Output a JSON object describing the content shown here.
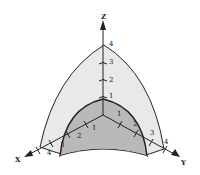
{
  "diagram": {
    "type": "3d-octant-spherical-shells",
    "axes": {
      "z": {
        "label": "Z",
        "ticks": [
          "1",
          "2",
          "3",
          "4"
        ]
      },
      "x": {
        "label": "X",
        "ticks": [
          "1",
          "2",
          "3",
          "4"
        ]
      },
      "y": {
        "label": "Y",
        "ticks": [
          "1",
          "2",
          "3",
          "4"
        ]
      }
    },
    "regions": {
      "outer_shell": {
        "radius_label": "4",
        "fill": "#e8e8e8"
      },
      "inner_shell": {
        "radius_label": "3",
        "fill": "#b8b8b8"
      }
    },
    "colors": {
      "stroke": "#222222",
      "background": "#ffffff"
    }
  }
}
